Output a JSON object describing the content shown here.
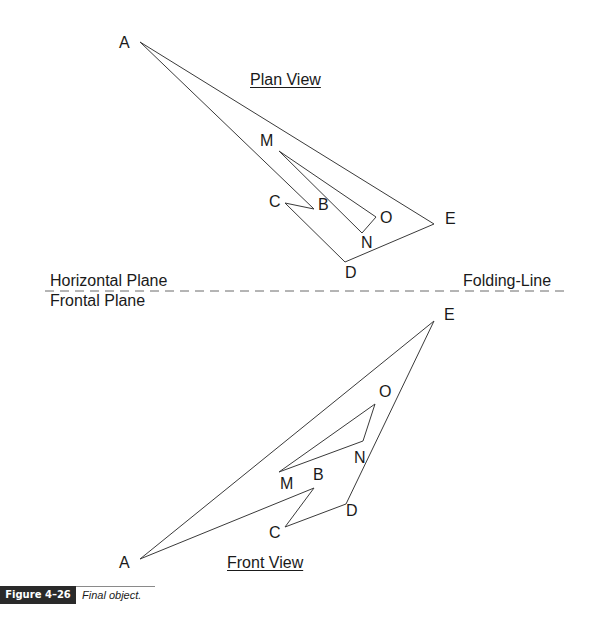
{
  "plan_view": {
    "title": "Plan View",
    "outer_polygon": [
      "A",
      "E",
      "D",
      "C",
      "B"
    ],
    "inner_polygon": [
      "M",
      "O",
      "N"
    ],
    "labels": {
      "A": "A",
      "M": "M",
      "C": "C",
      "B": "B",
      "O": "O",
      "N": "N",
      "E": "E",
      "D": "D"
    }
  },
  "front_view": {
    "title": "Front View",
    "outer_polygon": [
      "A",
      "E",
      "D",
      "C",
      "B"
    ],
    "inner_polygon": [
      "M",
      "O",
      "N"
    ],
    "labels": {
      "A": "A",
      "M": "M",
      "C": "C",
      "B": "B",
      "O": "O",
      "N": "N",
      "E": "E",
      "D": "D"
    }
  },
  "folding_line": {
    "upper_plane_label": "Horizontal Plane",
    "lower_plane_label": "Frontal Plane",
    "line_label": "Folding-Line"
  },
  "caption": {
    "figure_number": "Figure 4–26",
    "text": "Final object."
  }
}
